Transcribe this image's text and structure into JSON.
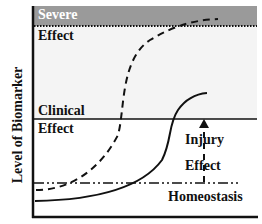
{
  "diagram": {
    "y_axis_label": "Level of Biomarker",
    "regions": {
      "severe_line1": "Severe",
      "severe_line2": "Effect",
      "clinical_line1": "Clinical",
      "clinical_line2": "Effect",
      "injury_line1": "Injury",
      "injury_line2": "Effect",
      "homeostasis": "Homeostasis"
    },
    "colors": {
      "severe_band": "#9a9a9a",
      "clinical_band": "#f2f2f2",
      "line": "#111111"
    }
  }
}
